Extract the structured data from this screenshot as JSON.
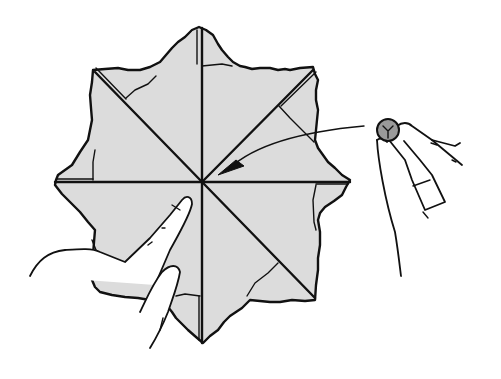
{
  "illustration": {
    "subject": "eight-pointed-star-paper-fold",
    "description": "Line drawing of a square sheet folded into an eight-pointed star with crease lines through the center; a hand places a coin at the center (arrow) while fingers hold the paper down.",
    "colors": {
      "background": "#ffffff",
      "paper": "#dcdcdc",
      "line": "#111111",
      "coin": "#9a9a9a",
      "skin": "#ffffff"
    },
    "center": {
      "x": 202,
      "y": 182
    },
    "elements": {
      "star": "star-folded-paper",
      "creases": [
        "vertical",
        "horizontal",
        "diagonal-nw-se",
        "diagonal-ne-sw"
      ],
      "coin": "coin-held-by-fingers",
      "arrow": "arrow-to-center",
      "left_hand": "hand-pressing-paper"
    }
  }
}
